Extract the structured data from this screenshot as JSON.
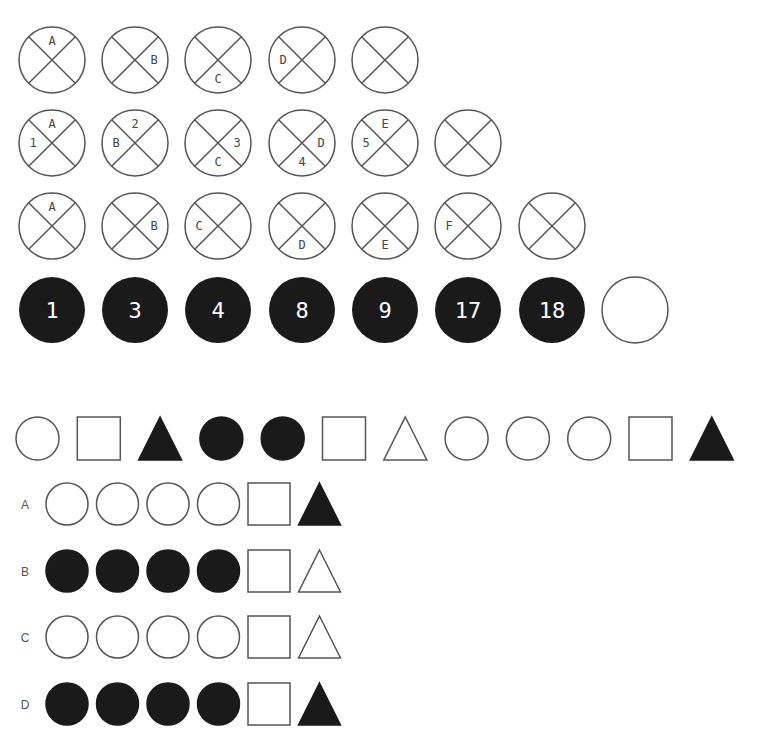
{
  "colors": {
    "stroke": "#555555",
    "fill_dark": "#1a1a1a",
    "background": "#ffffff",
    "number_text": "#ffffff"
  },
  "puzzle_1": {
    "rows": [
      {
        "cells": [
          {
            "labels": [
              {
                "text": "A",
                "pos": "top"
              }
            ]
          },
          {
            "labels": [
              {
                "text": "B",
                "pos": "right"
              }
            ]
          },
          {
            "labels": [
              {
                "text": "C",
                "pos": "bottom"
              }
            ]
          },
          {
            "labels": [
              {
                "text": "D",
                "pos": "left"
              }
            ]
          },
          {
            "labels": []
          }
        ]
      },
      {
        "cells": [
          {
            "labels": [
              {
                "text": "A",
                "pos": "top"
              },
              {
                "text": "1",
                "pos": "left"
              }
            ]
          },
          {
            "labels": [
              {
                "text": "2",
                "pos": "top"
              },
              {
                "text": "B",
                "pos": "left"
              }
            ]
          },
          {
            "labels": [
              {
                "text": "3",
                "pos": "right"
              },
              {
                "text": "C",
                "pos": "bottom"
              }
            ]
          },
          {
            "labels": [
              {
                "text": "D",
                "pos": "right"
              },
              {
                "text": "4",
                "pos": "bottom"
              }
            ]
          },
          {
            "labels": [
              {
                "text": "E",
                "pos": "top"
              },
              {
                "text": "5",
                "pos": "left"
              }
            ]
          },
          {
            "labels": []
          }
        ]
      },
      {
        "cells": [
          {
            "labels": [
              {
                "text": "A",
                "pos": "top"
              }
            ]
          },
          {
            "labels": [
              {
                "text": "B",
                "pos": "right"
              }
            ]
          },
          {
            "labels": [
              {
                "text": "C",
                "pos": "left"
              }
            ]
          },
          {
            "labels": [
              {
                "text": "D",
                "pos": "bottom"
              }
            ]
          },
          {
            "labels": [
              {
                "text": "E",
                "pos": "bottom"
              }
            ]
          },
          {
            "labels": [
              {
                "text": "F",
                "pos": "left"
              }
            ]
          },
          {
            "labels": []
          }
        ]
      }
    ]
  },
  "puzzle_2": {
    "numbers": [
      "1",
      "3",
      "4",
      "8",
      "9",
      "17",
      "18"
    ],
    "blank": true
  },
  "puzzle_3": {
    "sequence": [
      {
        "shape": "circle",
        "filled": false
      },
      {
        "shape": "square",
        "filled": false
      },
      {
        "shape": "triangle",
        "filled": true
      },
      {
        "shape": "circle",
        "filled": true
      },
      {
        "shape": "circle",
        "filled": true
      },
      {
        "shape": "square",
        "filled": false
      },
      {
        "shape": "triangle",
        "filled": false
      },
      {
        "shape": "circle",
        "filled": false
      },
      {
        "shape": "circle",
        "filled": false
      },
      {
        "shape": "circle",
        "filled": false
      },
      {
        "shape": "square",
        "filled": false
      },
      {
        "shape": "triangle",
        "filled": true
      }
    ],
    "options": [
      {
        "label": "A",
        "shapes": [
          {
            "shape": "circle",
            "filled": false
          },
          {
            "shape": "circle",
            "filled": false
          },
          {
            "shape": "circle",
            "filled": false
          },
          {
            "shape": "circle",
            "filled": false
          },
          {
            "shape": "square",
            "filled": false
          },
          {
            "shape": "triangle",
            "filled": true
          }
        ]
      },
      {
        "label": "B",
        "shapes": [
          {
            "shape": "circle",
            "filled": true
          },
          {
            "shape": "circle",
            "filled": true
          },
          {
            "shape": "circle",
            "filled": true
          },
          {
            "shape": "circle",
            "filled": true
          },
          {
            "shape": "square",
            "filled": false
          },
          {
            "shape": "triangle",
            "filled": false
          }
        ]
      },
      {
        "label": "C",
        "shapes": [
          {
            "shape": "circle",
            "filled": false
          },
          {
            "shape": "circle",
            "filled": false
          },
          {
            "shape": "circle",
            "filled": false
          },
          {
            "shape": "circle",
            "filled": false
          },
          {
            "shape": "square",
            "filled": false
          },
          {
            "shape": "triangle",
            "filled": false
          }
        ]
      },
      {
        "label": "D",
        "shapes": [
          {
            "shape": "circle",
            "filled": true
          },
          {
            "shape": "circle",
            "filled": true
          },
          {
            "shape": "circle",
            "filled": true
          },
          {
            "shape": "circle",
            "filled": true
          },
          {
            "shape": "square",
            "filled": false
          },
          {
            "shape": "triangle",
            "filled": true
          }
        ]
      }
    ]
  }
}
